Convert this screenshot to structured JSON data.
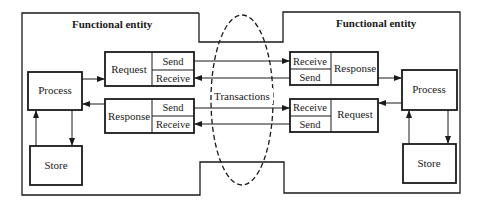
{
  "diagram": {
    "left_entity": {
      "title": "Functional entity",
      "process": "Process",
      "store": "Store",
      "request_module": {
        "name": "Request",
        "send": "Send",
        "receive": "Receive"
      },
      "response_module": {
        "name": "Response",
        "send": "Send",
        "receive": "Receive"
      }
    },
    "right_entity": {
      "title": "Functional entity",
      "process": "Process",
      "store": "Store",
      "response_module": {
        "name": "Response",
        "receive": "Receive",
        "send": "Send"
      },
      "request_module": {
        "name": "Request",
        "receive": "Receive",
        "send": "Send"
      }
    },
    "transactions_label": "Transactions"
  }
}
